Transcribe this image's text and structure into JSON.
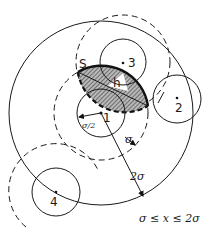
{
  "diagram": {
    "type": "geometric-figure",
    "particles": [
      {
        "id": "1",
        "label": "1",
        "cx": 101,
        "cy": 113,
        "r": 24
      },
      {
        "id": "2",
        "label": "2",
        "cx": 177,
        "cy": 99,
        "r": 24
      },
      {
        "id": "3",
        "label": "3",
        "cx": 123,
        "cy": 62,
        "r": 23
      },
      {
        "id": "4",
        "label": "4",
        "cx": 56,
        "cy": 192,
        "r": 24
      }
    ],
    "shells": {
      "sigma_shell_1": {
        "cx": 101,
        "cy": 113,
        "r": 47,
        "style": "dashed"
      },
      "two_sigma_shell_1": {
        "cx": 101,
        "cy": 113,
        "r": 92,
        "style": "solid"
      },
      "sigma_shell_3": {
        "cx": 123,
        "cy": 62,
        "r": 47,
        "style": "dashed"
      },
      "sigma_shell_4": {
        "cx": 56,
        "cy": 192,
        "r": 47,
        "style": "dashed-arc"
      }
    },
    "labels": {
      "region": "S",
      "height": "h",
      "half_sigma": "σ/2",
      "sigma": "σ",
      "two_sigma": "2σ",
      "condition": "σ ≤ x ≤ 2σ"
    },
    "colors": {
      "line": "#1a1a1a",
      "hatch_fill": "#8a8a8a",
      "background": "#ffffff"
    }
  }
}
